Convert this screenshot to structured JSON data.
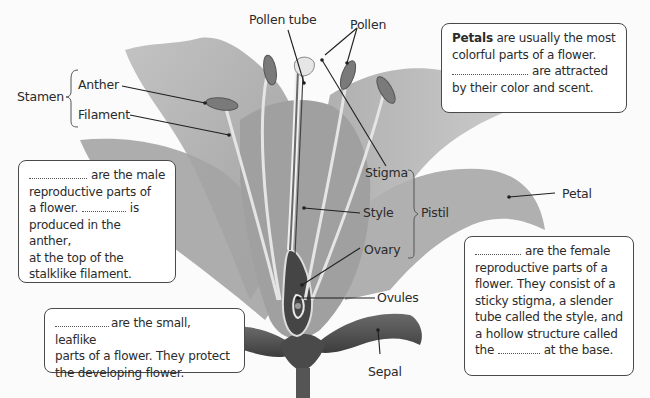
{
  "diagram": {
    "title": "Parts of a flower",
    "colors": {
      "background": "#fbfbfb",
      "petal": "#9a9a9a",
      "petal_light": "#b8b8b8",
      "sepal": "#5a5a5a",
      "box_border": "#4a4a4a",
      "text": "#2b2b2b"
    }
  },
  "labels": {
    "pollen_tube": "Pollen tube",
    "pollen": "Pollen",
    "stamen": "Stamen",
    "anther": "Anther",
    "filament": "Filament",
    "stigma": "Stigma",
    "style": "Style",
    "ovary": "Ovary",
    "pistil": "Pistil",
    "ovules": "Ovules",
    "petal": "Petal",
    "sepal": "Sepal"
  },
  "boxes": {
    "petals": {
      "bold_word": "Petals",
      "line1_rest": " are usually the most",
      "line2": "colorful parts of a flower.",
      "line3_after_blank": "are attracted",
      "line4": "by their color and scent."
    },
    "stamens": {
      "line1_after_blank": "are the male",
      "line2": "reproductive parts of",
      "line3_before_blank": "a flower.",
      "line3_after_blank": "is",
      "line4": "produced in the anther,",
      "line5": "at the top of the",
      "line6": "stalklike filament."
    },
    "sepals": {
      "line1_after_blank": "are the small, leaflike",
      "line2": "parts of a flower. They protect",
      "line3": "the developing flower."
    },
    "pistils": {
      "line1_after_blank": "are the female",
      "line2": "reproductive parts of a",
      "line3": "flower. They consist of a",
      "line4": "sticky stigma, a slender",
      "line5": "tube called the style, and",
      "line6": "a hollow structure called",
      "line7_before_blank": "the",
      "line7_after_blank": "at the base."
    }
  }
}
